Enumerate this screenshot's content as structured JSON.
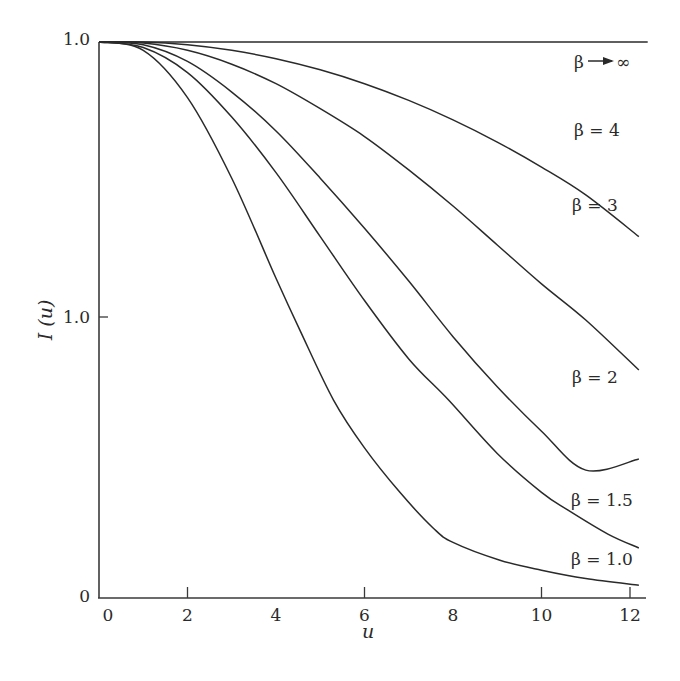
{
  "chart_data": {
    "type": "line",
    "title": "",
    "xlabel": "u",
    "ylabel": "I (u)",
    "xlim": [
      0,
      12.4
    ],
    "ylim": [
      0,
      1
    ],
    "grid": false,
    "legend": "inline labels at right end of each curve",
    "x_ticks": [
      {
        "value": 0,
        "label": "0",
        "tick_mark": false
      },
      {
        "value": 2,
        "label": "2",
        "tick_mark": true
      },
      {
        "value": 4,
        "label": "4",
        "tick_mark": false
      },
      {
        "value": 6,
        "label": "6",
        "tick_mark": true
      },
      {
        "value": 8,
        "label": "8",
        "tick_mark": false
      },
      {
        "value": 10,
        "label": "10",
        "tick_mark": true
      },
      {
        "value": 12,
        "label": "12",
        "tick_mark": true
      }
    ],
    "y_ticks": [
      {
        "value": 0,
        "label": "0",
        "tick_mark": false
      },
      {
        "value": 0.5,
        "label": "1.0",
        "tick_mark": true
      },
      {
        "value": 1.0,
        "label": "1.0",
        "tick_mark": false
      }
    ],
    "series": [
      {
        "name": "β→∞",
        "label": "β→∞",
        "x": [
          0,
          12.4
        ],
        "values": [
          1.0,
          1.0
        ]
      },
      {
        "name": "β = 4",
        "label": "β = 4",
        "x": [
          0,
          1,
          2,
          3,
          4,
          5,
          6,
          7,
          8,
          9,
          10,
          11,
          12.2
        ],
        "values": [
          1.0,
          1.0,
          0.995,
          0.985,
          0.97,
          0.95,
          0.925,
          0.895,
          0.86,
          0.82,
          0.775,
          0.725,
          0.65
        ]
      },
      {
        "name": "β = 3",
        "label": "β = 3",
        "x": [
          0,
          1,
          2,
          3,
          4,
          5,
          6,
          7,
          8,
          9,
          10,
          11,
          12.2
        ],
        "values": [
          1.0,
          0.998,
          0.985,
          0.96,
          0.925,
          0.88,
          0.83,
          0.77,
          0.705,
          0.635,
          0.565,
          0.5,
          0.41
        ]
      },
      {
        "name": "β = 2",
        "label": "β = 2",
        "x": [
          0,
          1,
          2,
          3,
          4,
          5,
          6,
          7,
          8,
          9,
          10,
          11,
          12.2
        ],
        "values": [
          1.0,
          0.995,
          0.965,
          0.91,
          0.84,
          0.755,
          0.665,
          0.57,
          0.47,
          0.38,
          0.3,
          0.23,
          0.25
        ]
      },
      {
        "name": "β = 1.5",
        "label": "β = 1.5",
        "x": [
          0,
          1,
          2,
          3,
          4,
          5,
          6,
          7,
          7.9,
          9,
          10,
          10.6,
          11.5,
          12.2
        ],
        "values": [
          1.0,
          0.99,
          0.945,
          0.865,
          0.765,
          0.65,
          0.535,
          0.43,
          0.356,
          0.26,
          0.19,
          0.158,
          0.115,
          0.09
        ]
      },
      {
        "name": "β = 1.0",
        "label": "β = 1.0",
        "x": [
          0,
          1,
          2,
          3,
          4,
          4.55,
          5.3,
          6,
          6.8,
          7.55,
          8,
          9.06,
          10,
          11,
          12.2
        ],
        "values": [
          1.0,
          0.985,
          0.9,
          0.755,
          0.575,
          0.48,
          0.356,
          0.27,
          0.19,
          0.126,
          0.1,
          0.068,
          0.05,
          0.035,
          0.023
        ]
      }
    ]
  },
  "axes": {
    "x_title": "u",
    "y_title": "I (u)"
  },
  "labels": {
    "beta_inf": "β",
    "beta_inf_arrow_target": "∞",
    "beta_4": "β = 4",
    "beta_3": "β = 3",
    "beta_2": "β = 2",
    "beta_1_5": "β = 1.5",
    "beta_1_0": "β = 1.0"
  },
  "colors": {
    "ink": "#2a2a2a",
    "background": "#ffffff"
  }
}
